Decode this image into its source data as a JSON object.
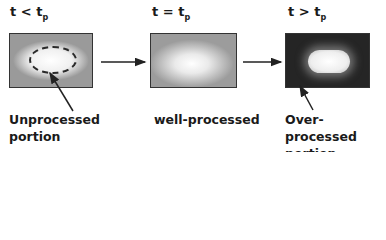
{
  "stages": [
    {
      "condition": "t < t",
      "sub": "p",
      "caption_line1": "Unprocessed",
      "caption_line2": "portion"
    },
    {
      "condition": "t = t",
      "sub": "p",
      "caption_line1": "well-processed",
      "caption_line2": ""
    },
    {
      "condition": "t > t",
      "sub": "p",
      "caption_line1": "Over-processed",
      "caption_line2": "portion"
    }
  ]
}
